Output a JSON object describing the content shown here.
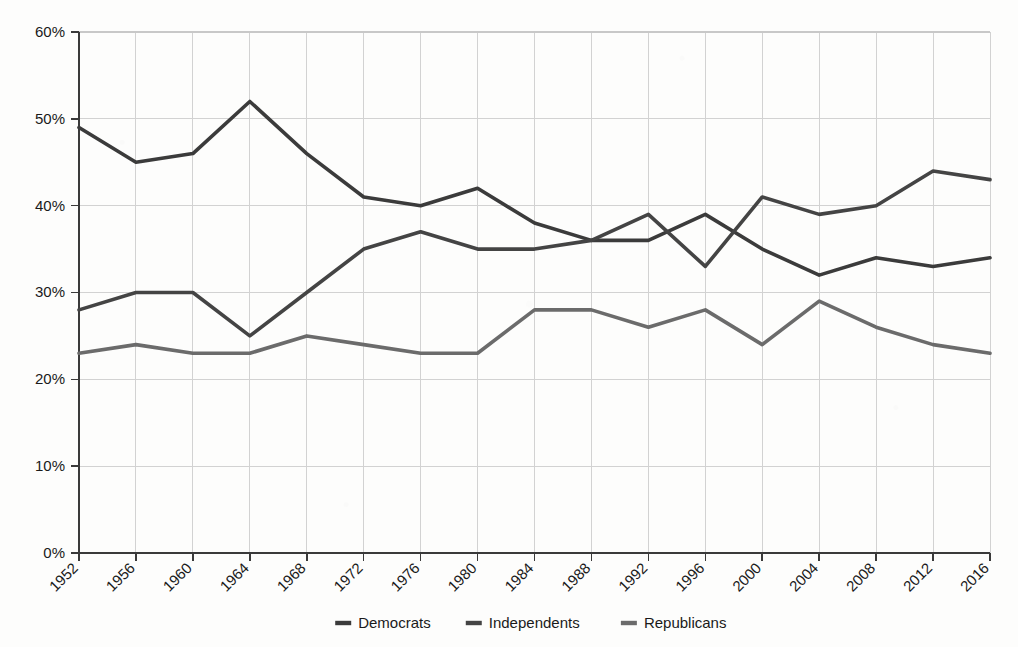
{
  "chart_data": {
    "type": "line",
    "title": "",
    "subtitle": "",
    "xlabel": "",
    "ylabel": "",
    "grid": true,
    "legend_position": "bottom",
    "ylim": [
      0,
      60
    ],
    "ytick_labels": [
      "0%",
      "10%",
      "20%",
      "30%",
      "40%",
      "50%",
      "60%"
    ],
    "ytick_values": [
      0,
      10,
      20,
      30,
      40,
      50,
      60
    ],
    "categories": [
      "1952",
      "1956",
      "1960",
      "1964",
      "1968",
      "1972",
      "1976",
      "1980",
      "1984",
      "1988",
      "1992",
      "1996",
      "2000",
      "2004",
      "2008",
      "2012",
      "2016"
    ],
    "series": [
      {
        "name": "Democrats",
        "color": "#3b3b3b",
        "values": [
          49,
          45,
          46,
          52,
          46,
          41,
          40,
          42,
          38,
          36,
          36,
          39,
          35,
          32,
          34,
          33,
          34
        ]
      },
      {
        "name": "Independents",
        "color": "#444444",
        "values": [
          28,
          30,
          30,
          25,
          30,
          35,
          37,
          35,
          35,
          36,
          39,
          33,
          41,
          39,
          40,
          44,
          43
        ]
      },
      {
        "name": "Republicans",
        "color": "#6b6b6b",
        "values": [
          23,
          24,
          23,
          23,
          25,
          24,
          23,
          23,
          28,
          28,
          26,
          28,
          24,
          29,
          26,
          24,
          23
        ]
      }
    ]
  },
  "legend": {
    "items": [
      {
        "label": "Democrats"
      },
      {
        "label": "Independents"
      },
      {
        "label": "Republicans"
      }
    ]
  },
  "axes": {
    "y_axis_name": "percentage-axis",
    "x_axis_name": "year-axis"
  }
}
